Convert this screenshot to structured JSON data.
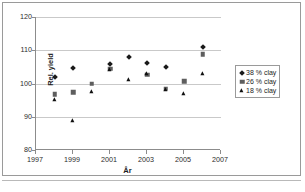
{
  "chart_data": {
    "type": "scatter",
    "title": "",
    "xlabel": "År",
    "ylabel": "Rel. yield",
    "xlim": [
      1997,
      2007
    ],
    "ylim": [
      80,
      120
    ],
    "xticks": [
      1997,
      1999,
      2001,
      2003,
      2005,
      2007
    ],
    "yticks": [
      80,
      90,
      100,
      110,
      120
    ],
    "grid": "horizontal",
    "legend_position": "right",
    "series": [
      {
        "name": "38 % clay",
        "marker": "diamond",
        "color": "#1a1a1a",
        "points": [
          {
            "x": 1998,
            "y": 102.0
          },
          {
            "x": 1999,
            "y": 104.6
          },
          {
            "x": 2001,
            "y": 106.0
          },
          {
            "x": 2002,
            "y": 108.0
          },
          {
            "x": 2003,
            "y": 106.3
          },
          {
            "x": 2004,
            "y": 105.0
          },
          {
            "x": 2006,
            "y": 111.0
          }
        ]
      },
      {
        "name": "26 % clay",
        "marker": "square",
        "color": "#5e5e5e",
        "points": [
          {
            "x": 1998,
            "y": 96.7
          },
          {
            "x": 1999,
            "y": 97.4
          },
          {
            "x": 2000,
            "y": 100.0
          },
          {
            "x": 2001,
            "y": 104.4
          },
          {
            "x": 2003,
            "y": 102.6
          },
          {
            "x": 2004,
            "y": 98.4
          },
          {
            "x": 2005,
            "y": 100.7
          },
          {
            "x": 2006,
            "y": 108.8
          }
        ]
      },
      {
        "name": "18 % clay",
        "marker": "triangle",
        "color": "#0f0f0f",
        "points": [
          {
            "x": 1998,
            "y": 95.0
          },
          {
            "x": 1999,
            "y": 88.7
          },
          {
            "x": 2000,
            "y": 97.5
          },
          {
            "x": 2001,
            "y": 104.0
          },
          {
            "x": 2002,
            "y": 101.2
          },
          {
            "x": 2003,
            "y": 103.0
          },
          {
            "x": 2004,
            "y": 98.0
          },
          {
            "x": 2005,
            "y": 96.8
          },
          {
            "x": 2006,
            "y": 102.8
          }
        ]
      }
    ]
  },
  "axis": {
    "y_title": "Rel. yield",
    "x_title": "År",
    "y_tick_labels": [
      "120",
      "110",
      "100",
      "90",
      "80"
    ],
    "x_tick_labels": [
      "1997",
      "1999",
      "2001",
      "2003",
      "2005",
      "2007"
    ]
  },
  "legend": {
    "entries": [
      {
        "label": "38 % clay"
      },
      {
        "label": "26 % clay"
      },
      {
        "label": "18 % clay"
      }
    ]
  }
}
